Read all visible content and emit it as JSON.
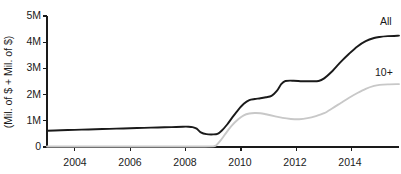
{
  "chart_data": {
    "type": "line",
    "title": "",
    "subtitle": "",
    "xlabel": "",
    "ylabel": "(Mil. of $ + Mil. of $)",
    "xlim": [
      2003.0,
      2015.7
    ],
    "ylim": [
      0,
      5000000
    ],
    "grid": false,
    "legend_position": "right-inline-labels",
    "y_tick_labels": [
      "0",
      "1M",
      "2M",
      "3M",
      "4M",
      "5M"
    ],
    "y_tick_values": [
      0,
      1000000,
      2000000,
      3000000,
      4000000,
      5000000
    ],
    "x_tick_labels": [
      "2004",
      "2006",
      "2008",
      "2010",
      "2012",
      "2014"
    ],
    "x_tick_values": [
      2004,
      2006,
      2008,
      2010,
      2012,
      2014
    ],
    "series": [
      {
        "name": "All",
        "label": "All",
        "color": "#1a1a1a",
        "stroke_width": 1.9,
        "x": [
          2003.0,
          2003.5,
          2004.0,
          2004.5,
          2005.0,
          2005.5,
          2006.0,
          2006.5,
          2007.0,
          2007.5,
          2007.9,
          2008.1,
          2008.25,
          2008.4,
          2008.55,
          2008.75,
          2009.0,
          2009.15,
          2009.3,
          2009.5,
          2009.7,
          2009.9,
          2010.1,
          2010.3,
          2010.5,
          2010.7,
          2010.9,
          2011.1,
          2011.3,
          2011.45,
          2011.6,
          2011.9,
          2012.2,
          2012.5,
          2012.8,
          2013.0,
          2013.3,
          2013.6,
          2013.9,
          2014.2,
          2014.5,
          2014.8,
          2015.0,
          2015.3,
          2015.7
        ],
        "y": [
          620000,
          640000,
          655000,
          670000,
          685000,
          700000,
          715000,
          730000,
          745000,
          760000,
          775000,
          775000,
          760000,
          700000,
          560000,
          490000,
          480000,
          500000,
          620000,
          860000,
          1150000,
          1420000,
          1650000,
          1790000,
          1830000,
          1860000,
          1900000,
          1950000,
          2150000,
          2400000,
          2520000,
          2530000,
          2510000,
          2510000,
          2520000,
          2620000,
          2900000,
          3250000,
          3560000,
          3840000,
          4040000,
          4160000,
          4200000,
          4230000,
          4250000
        ]
      },
      {
        "name": "10+",
        "label": "10+",
        "color": "#c8c8c8",
        "stroke_width": 1.9,
        "x": [
          2003.0,
          2004.0,
          2005.0,
          2006.0,
          2007.0,
          2008.0,
          2008.6,
          2009.0,
          2009.1,
          2009.25,
          2009.45,
          2009.65,
          2009.9,
          2010.1,
          2010.3,
          2010.5,
          2010.7,
          2010.9,
          2011.2,
          2011.5,
          2011.8,
          2012.1,
          2012.4,
          2012.7,
          2013.0,
          2013.3,
          2013.6,
          2013.9,
          2014.2,
          2014.5,
          2014.8,
          2015.0,
          2015.3,
          2015.7
        ],
        "y": [
          20000,
          20000,
          20000,
          20000,
          20000,
          20000,
          20000,
          25000,
          60000,
          230000,
          520000,
          800000,
          1060000,
          1210000,
          1280000,
          1300000,
          1290000,
          1250000,
          1180000,
          1110000,
          1070000,
          1060000,
          1100000,
          1180000,
          1290000,
          1480000,
          1680000,
          1880000,
          2060000,
          2220000,
          2330000,
          2370000,
          2390000,
          2400000
        ]
      }
    ]
  },
  "axis": {
    "y_title": "(Mil. of $ + Mil. of $)"
  }
}
